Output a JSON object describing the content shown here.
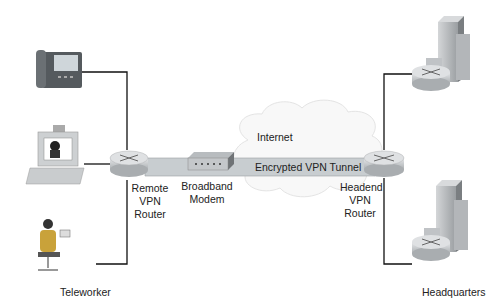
{
  "diagram": {
    "type": "network-topology",
    "nodes": {
      "phone": {
        "label": "",
        "icon": "ip-phone-icon"
      },
      "pc": {
        "label": "",
        "icon": "computer-icon"
      },
      "teleworker": {
        "label": "Teleworker",
        "icon": "person-at-desk-icon"
      },
      "remote_router": {
        "label_lines": [
          "Remote",
          "VPN",
          "Router"
        ],
        "icon": "router-icon"
      },
      "modem": {
        "label_lines": [
          "Broadband",
          "Modem"
        ],
        "icon": "modem-icon"
      },
      "internet": {
        "label": "Internet",
        "icon": "cloud-icon"
      },
      "headend_router": {
        "label_lines": [
          "Headend",
          "VPN",
          "Router"
        ],
        "icon": "router-icon"
      },
      "hq_top": {
        "label": "",
        "icon": "building-router-icon"
      },
      "hq_bottom": {
        "label": "",
        "icon": "building-router-icon"
      },
      "headquarters": {
        "label": "Headquarters"
      }
    },
    "tunnel": {
      "label": "Encrypted VPN Tunnel",
      "color": "#c8cdd0"
    },
    "colors": {
      "line": "#111111",
      "router": "#c9ccce",
      "cloud": "#f7f7f7"
    }
  }
}
